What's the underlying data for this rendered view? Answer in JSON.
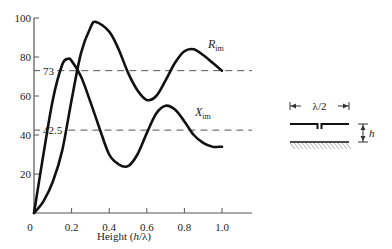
{
  "chart_data": {
    "type": "line",
    "title": "",
    "xlabel": "Height (h/λ)",
    "xlabel_parts": {
      "prefix": "Height (",
      "var": "h",
      "suffix": "/λ)"
    },
    "ylabel": "",
    "xlim": [
      0,
      1.0
    ],
    "ylim": [
      0,
      100
    ],
    "x_ticks": [
      "0",
      "0.2",
      "0.4",
      "0.6",
      "0.8",
      "1.0"
    ],
    "y_ticks": [
      "20",
      "40",
      "60",
      "80",
      "100"
    ],
    "grid": false,
    "legend": "inline labels",
    "reference_lines": [
      {
        "value": 73,
        "label": "73",
        "style": "dashed"
      },
      {
        "value": 42.5,
        "label": "42.5",
        "style": "dashed"
      }
    ],
    "series": [
      {
        "name": "R_im",
        "label_main": "R",
        "label_sub": "im",
        "x": [
          0.0,
          0.05,
          0.1,
          0.15,
          0.2,
          0.25,
          0.3,
          0.33,
          0.4,
          0.45,
          0.5,
          0.55,
          0.6,
          0.65,
          0.7,
          0.75,
          0.8,
          0.85,
          0.9,
          0.95,
          1.0
        ],
        "values": [
          0,
          6,
          16,
          32,
          58,
          82,
          95,
          98,
          93,
          84,
          72,
          63,
          58,
          60,
          68,
          77,
          83,
          84,
          81,
          77,
          73
        ]
      },
      {
        "name": "X_im",
        "label_main": "X",
        "label_sub": "im",
        "x": [
          0.0,
          0.05,
          0.1,
          0.15,
          0.18,
          0.2,
          0.25,
          0.3,
          0.35,
          0.4,
          0.45,
          0.5,
          0.55,
          0.6,
          0.65,
          0.7,
          0.75,
          0.8,
          0.85,
          0.9,
          0.95,
          1.0
        ],
        "values": [
          0,
          30,
          58,
          76,
          79,
          78,
          70,
          57,
          43,
          30,
          25,
          24,
          30,
          41,
          51,
          55,
          53,
          47,
          40,
          36,
          34,
          34
        ]
      }
    ]
  },
  "schematic": {
    "dimension_label": "λ/2",
    "height_label": "h"
  }
}
